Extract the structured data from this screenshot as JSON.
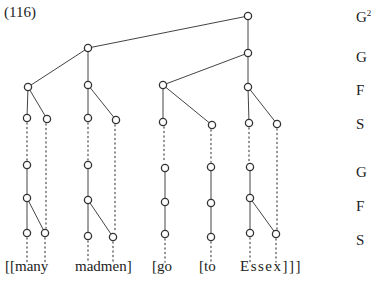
{
  "example_number": "(116)",
  "level_labels": [
    {
      "text": "G",
      "sup": "2",
      "y": 8
    },
    {
      "text": "G",
      "sup": "",
      "y": 49
    },
    {
      "text": "F",
      "sup": "",
      "y": 82
    },
    {
      "text": "S",
      "sup": "",
      "y": 116
    },
    {
      "text": "G",
      "sup": "",
      "y": 164
    },
    {
      "text": "F",
      "sup": "",
      "y": 198
    },
    {
      "text": "S",
      "sup": "",
      "y": 232
    }
  ],
  "words": [
    {
      "text": "[[many",
      "x": 5
    },
    {
      "text": "madmen]",
      "x": 75
    },
    {
      "text": "[go",
      "x": 152
    },
    {
      "text": "[to",
      "x": 199
    },
    {
      "text": "Essex]]]",
      "x": 240
    }
  ],
  "tree": {
    "nodes": [
      {
        "id": "g2",
        "x": 248,
        "y": 16
      },
      {
        "id": "gL",
        "x": 88,
        "y": 48
      },
      {
        "id": "gR",
        "x": 248,
        "y": 53
      },
      {
        "id": "f1",
        "x": 28,
        "y": 87
      },
      {
        "id": "f2",
        "x": 88,
        "y": 85
      },
      {
        "id": "f3",
        "x": 163,
        "y": 85
      },
      {
        "id": "f4",
        "x": 248,
        "y": 87
      },
      {
        "id": "s1",
        "x": 27,
        "y": 118
      },
      {
        "id": "s2",
        "x": 47,
        "y": 119
      },
      {
        "id": "s3",
        "x": 88,
        "y": 118
      },
      {
        "id": "s4",
        "x": 116,
        "y": 120
      },
      {
        "id": "s5",
        "x": 163,
        "y": 122
      },
      {
        "id": "s6",
        "x": 212,
        "y": 125
      },
      {
        "id": "s7",
        "x": 249,
        "y": 123
      },
      {
        "id": "s8",
        "x": 277,
        "y": 124
      },
      {
        "id": "lg1",
        "x": 27,
        "y": 165
      },
      {
        "id": "lf1",
        "x": 27,
        "y": 198
      },
      {
        "id": "ls1",
        "x": 27,
        "y": 233
      },
      {
        "id": "ls2",
        "x": 45,
        "y": 233
      },
      {
        "id": "lg2",
        "x": 88,
        "y": 165
      },
      {
        "id": "lf2",
        "x": 88,
        "y": 200
      },
      {
        "id": "ls3",
        "x": 88,
        "y": 236
      },
      {
        "id": "ls4",
        "x": 113,
        "y": 237
      },
      {
        "id": "lg3",
        "x": 165,
        "y": 168
      },
      {
        "id": "lf3",
        "x": 165,
        "y": 202
      },
      {
        "id": "ls5",
        "x": 165,
        "y": 234
      },
      {
        "id": "lg4",
        "x": 211,
        "y": 167
      },
      {
        "id": "lf4",
        "x": 211,
        "y": 203
      },
      {
        "id": "ls6",
        "x": 211,
        "y": 237
      },
      {
        "id": "lg5",
        "x": 250,
        "y": 167
      },
      {
        "id": "lf5",
        "x": 250,
        "y": 198
      },
      {
        "id": "ls7",
        "x": 250,
        "y": 233
      },
      {
        "id": "ls8",
        "x": 276,
        "y": 234
      }
    ],
    "edges": [
      [
        "g2",
        "gL"
      ],
      [
        "g2",
        "gR"
      ],
      [
        "gL",
        "f1"
      ],
      [
        "gL",
        "f2"
      ],
      [
        "gR",
        "f3"
      ],
      [
        "gR",
        "f4"
      ],
      [
        "f1",
        "s1"
      ],
      [
        "f1",
        "s2"
      ],
      [
        "f2",
        "s3"
      ],
      [
        "f2",
        "s4"
      ],
      [
        "f3",
        "s5"
      ],
      [
        "f3",
        "s6"
      ],
      [
        "f4",
        "s7"
      ],
      [
        "f4",
        "s8"
      ],
      [
        "lg1",
        "lf1"
      ],
      [
        "lf1",
        "ls1"
      ],
      [
        "lf1",
        "ls2"
      ],
      [
        "lg2",
        "lf2"
      ],
      [
        "lf2",
        "ls3"
      ],
      [
        "lf2",
        "ls4"
      ],
      [
        "lg3",
        "lf3"
      ],
      [
        "lf3",
        "ls5"
      ],
      [
        "lg4",
        "lf4"
      ],
      [
        "lf4",
        "ls6"
      ],
      [
        "lg5",
        "lf5"
      ],
      [
        "lf5",
        "ls7"
      ],
      [
        "lf5",
        "ls8"
      ]
    ],
    "dotted": [
      {
        "x": 27,
        "y1": 123,
        "y2": 160
      },
      {
        "x": 46,
        "y1": 124,
        "y2": 228
      },
      {
        "x": 88,
        "y1": 123,
        "y2": 160
      },
      {
        "x": 115,
        "y1": 125,
        "y2": 232
      },
      {
        "x": 164,
        "y1": 127,
        "y2": 163
      },
      {
        "x": 211,
        "y1": 130,
        "y2": 162
      },
      {
        "x": 249,
        "y1": 128,
        "y2": 162
      },
      {
        "x": 277,
        "y1": 129,
        "y2": 229
      },
      {
        "x": 27,
        "y1": 238,
        "y2": 262
      },
      {
        "x": 45,
        "y1": 238,
        "y2": 262
      },
      {
        "x": 88,
        "y1": 241,
        "y2": 262
      },
      {
        "x": 113,
        "y1": 242,
        "y2": 262
      },
      {
        "x": 165,
        "y1": 239,
        "y2": 262
      },
      {
        "x": 211,
        "y1": 242,
        "y2": 262
      },
      {
        "x": 250,
        "y1": 238,
        "y2": 262
      },
      {
        "x": 276,
        "y1": 239,
        "y2": 262
      }
    ]
  }
}
